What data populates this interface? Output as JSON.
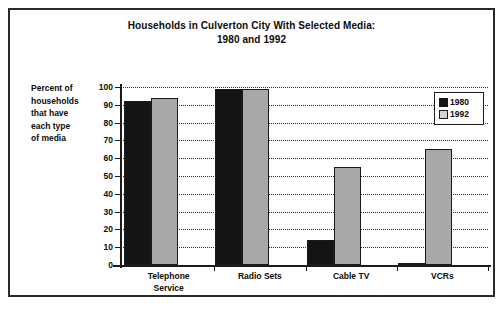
{
  "chart_data": {
    "type": "bar",
    "title": "Households in Culverton City With Selected Media:",
    "subtitle": "1980 and 1992",
    "title_lines": [
      "Households in Culverton City With Selected Media:",
      "1980 and 1992"
    ],
    "xlabel": "",
    "ylabel": "Percent of households that have each type of media",
    "ylabel_lines": [
      "Percent of",
      "households",
      "that have",
      "each type",
      "of media"
    ],
    "categories": [
      "Telephone Service",
      "Radio Sets",
      "Cable TV",
      "VCRs"
    ],
    "category_label_lines": [
      [
        "Telephone",
        "Service"
      ],
      [
        "Radio Sets"
      ],
      [
        "Cable TV"
      ],
      [
        "VCRs"
      ]
    ],
    "series": [
      {
        "name": "1980",
        "color": "#141414",
        "values": [
          92,
          99,
          14,
          1
        ]
      },
      {
        "name": "1992",
        "color": "#a8a8a8",
        "values": [
          94,
          99,
          55,
          65
        ]
      }
    ],
    "ylim": [
      0,
      100
    ],
    "ytick_step": 10,
    "yticks": [
      100,
      90,
      80,
      70,
      60,
      50,
      40,
      30,
      20,
      10,
      0
    ],
    "ytick_labels": [
      "100",
      "90",
      "80",
      "70",
      "60",
      "50",
      "40",
      "30",
      "20",
      "10",
      "0"
    ],
    "grid": true,
    "grid_style": "dotted-horizontal",
    "legend": {
      "position": "top-right-inside",
      "entries": [
        {
          "label": "1980",
          "swatch_color": "#141414"
        },
        {
          "label": "1992",
          "swatch_color": "#d4d4d4"
        }
      ]
    }
  },
  "colors": {
    "frame": "#2a2a2a",
    "axis": "#1c1c1c",
    "text": "#0b0b0b",
    "background": "#ffffff",
    "series_1980": "#141414",
    "series_1992": "#a8a8a8"
  }
}
